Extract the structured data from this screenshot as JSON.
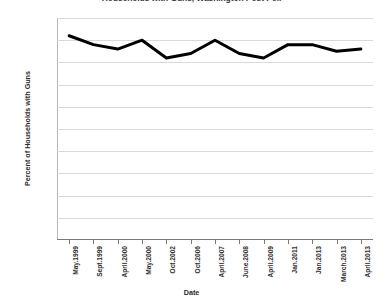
{
  "chart_data": {
    "type": "line",
    "title": "Households with Guns, Washington Post Poll",
    "xlabel": "Date",
    "ylabel": "Percent of Households with Guns",
    "categories": [
      "May.1999",
      "Sept.1999",
      "April.2000",
      "May.2000",
      "Oct.2002",
      "Oct.2006",
      "April.2007",
      "June.2008",
      "April.2009",
      "Jan.2011",
      "Jan.2013",
      "March.2013",
      "April.2013"
    ],
    "values": [
      46,
      44,
      43,
      45,
      41,
      42,
      45,
      42,
      41,
      44,
      44,
      42.5,
      43
    ],
    "ylim": [
      0,
      50
    ],
    "ytick_labels": [
      "50%",
      "45%",
      "40%",
      "35%",
      "30%",
      "25%",
      "20%",
      "15%",
      "10%",
      "5%",
      "0%"
    ],
    "ytick_values": [
      50,
      45,
      40,
      35,
      30,
      25,
      20,
      15,
      10,
      5,
      0
    ],
    "grid": true,
    "legend": "none",
    "series_color": "#000000"
  }
}
